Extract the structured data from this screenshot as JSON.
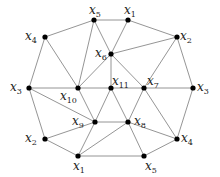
{
  "diagram": {
    "type": "graph",
    "nodes": [
      {
        "id": "n_x5_top",
        "base": "x",
        "sub": "5",
        "x": 94,
        "y": 20,
        "lx": 89,
        "ly": 14
      },
      {
        "id": "n_x1_top",
        "base": "x",
        "sub": "1",
        "x": 128,
        "y": 20,
        "lx": 124,
        "ly": 14
      },
      {
        "id": "n_x4_left",
        "base": "x",
        "sub": "4",
        "x": 45,
        "y": 37,
        "lx": 25,
        "ly": 40
      },
      {
        "id": "n_x2_right",
        "base": "x",
        "sub": "2",
        "x": 177,
        "y": 37,
        "lx": 180,
        "ly": 40
      },
      {
        "id": "n_x6",
        "base": "x",
        "sub": "6",
        "x": 111,
        "y": 54,
        "lx": 95,
        "ly": 57
      },
      {
        "id": "n_x3_left",
        "base": "x",
        "sub": "3",
        "x": 29,
        "y": 88,
        "lx": 10,
        "ly": 91
      },
      {
        "id": "n_x10",
        "base": "x",
        "sub": "10",
        "x": 78,
        "y": 88,
        "lx": 60,
        "ly": 100
      },
      {
        "id": "n_x11",
        "base": "x",
        "sub": "11",
        "x": 111,
        "y": 88,
        "lx": 112,
        "ly": 85
      },
      {
        "id": "n_x7",
        "base": "x",
        "sub": "7",
        "x": 144,
        "y": 88,
        "lx": 147,
        "ly": 85
      },
      {
        "id": "n_x3_right",
        "base": "x",
        "sub": "3",
        "x": 193,
        "y": 88,
        "lx": 197,
        "ly": 91
      },
      {
        "id": "n_x9",
        "base": "x",
        "sub": "9",
        "x": 95,
        "y": 122,
        "lx": 72,
        "ly": 125
      },
      {
        "id": "n_x8",
        "base": "x",
        "sub": "8",
        "x": 128,
        "y": 122,
        "lx": 134,
        "ly": 125
      },
      {
        "id": "n_x2_left",
        "base": "x",
        "sub": "2",
        "x": 45,
        "y": 139,
        "lx": 25,
        "ly": 142
      },
      {
        "id": "n_x4_right",
        "base": "x",
        "sub": "4",
        "x": 177,
        "y": 139,
        "lx": 181,
        "ly": 142
      },
      {
        "id": "n_x1_bottom",
        "base": "x",
        "sub": "1",
        "x": 78,
        "y": 156,
        "lx": 73,
        "ly": 170
      },
      {
        "id": "n_x5_bottom",
        "base": "x",
        "sub": "5",
        "x": 144,
        "y": 156,
        "lx": 145,
        "ly": 170
      }
    ],
    "edges": [
      [
        "n_x5_top",
        "n_x1_top"
      ],
      [
        "n_x5_top",
        "n_x4_left"
      ],
      [
        "n_x5_top",
        "n_x10"
      ],
      [
        "n_x5_top",
        "n_x6"
      ],
      [
        "n_x1_top",
        "n_x6"
      ],
      [
        "n_x1_top",
        "n_x2_right"
      ],
      [
        "n_x4_left",
        "n_x3_left"
      ],
      [
        "n_x4_left",
        "n_x10"
      ],
      [
        "n_x6",
        "n_x2_right"
      ],
      [
        "n_x6",
        "n_x10"
      ],
      [
        "n_x6",
        "n_x11"
      ],
      [
        "n_x6",
        "n_x7"
      ],
      [
        "n_x2_right",
        "n_x7"
      ],
      [
        "n_x2_right",
        "n_x3_right"
      ],
      [
        "n_x3_left",
        "n_x10"
      ],
      [
        "n_x3_left",
        "n_x9"
      ],
      [
        "n_x3_left",
        "n_x2_left"
      ],
      [
        "n_x10",
        "n_x11"
      ],
      [
        "n_x11",
        "n_x7"
      ],
      [
        "n_x7",
        "n_x3_right"
      ],
      [
        "n_x10",
        "n_x9"
      ],
      [
        "n_x11",
        "n_x9"
      ],
      [
        "n_x11",
        "n_x8"
      ],
      [
        "n_x7",
        "n_x8"
      ],
      [
        "n_x7",
        "n_x4_right"
      ],
      [
        "n_x3_right",
        "n_x4_right"
      ],
      [
        "n_x9",
        "n_x8"
      ],
      [
        "n_x9",
        "n_x2_left"
      ],
      [
        "n_x9",
        "n_x1_bottom"
      ],
      [
        "n_x8",
        "n_x1_bottom"
      ],
      [
        "n_x8",
        "n_x4_right"
      ],
      [
        "n_x8",
        "n_x5_bottom"
      ],
      [
        "n_x2_left",
        "n_x1_bottom"
      ],
      [
        "n_x1_bottom",
        "n_x5_bottom"
      ],
      [
        "n_x5_bottom",
        "n_x4_right"
      ]
    ]
  }
}
